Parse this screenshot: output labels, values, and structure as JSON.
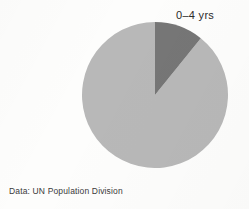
{
  "figure": {
    "background_color": "#fdfdfc",
    "source_caption": "Data: UN Population Division"
  },
  "labels": {
    "slice_label": "0–4 yrs"
  },
  "chart_data": {
    "type": "pie",
    "title": "",
    "subtitle": "",
    "xlabel": "",
    "ylabel": "",
    "grid": false,
    "legend_position": "none",
    "start_angle_deg": 0,
    "direction": "clockwise",
    "center_px": [
      155,
      95
    ],
    "radius_px": 73,
    "categories": [
      "0–4 yrs",
      "5+ yrs"
    ],
    "values": [
      10.8,
      89.2
    ],
    "value_unit": "percent",
    "slice_angles_deg": [
      39,
      321
    ],
    "colors": [
      "#767676",
      "#b8b8b8"
    ],
    "labeled_slices": [
      "0–4 yrs"
    ],
    "annotations": [
      "Data: UN Population Division"
    ]
  }
}
